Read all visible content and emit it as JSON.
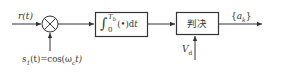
{
  "diagram": {
    "type": "block-diagram",
    "title": "",
    "input": {
      "label_main": "r",
      "label_arg": "(t)"
    },
    "multiplier": {
      "symbol": "⊗"
    },
    "carrier": {
      "label_s": "s",
      "label_sub": "1",
      "label_rest": "(t)=cos(ω",
      "label_csub": "c",
      "label_end": "t)"
    },
    "integrator": {
      "int_symbol": "∫",
      "upper_limit": "T",
      "upper_sub": "b",
      "lower_limit": "0",
      "body": "(•)d",
      "var": "t"
    },
    "decision": {
      "label": "判决"
    },
    "threshold": {
      "label_main": "V",
      "label_sub": "d"
    },
    "output": {
      "open": "{",
      "label_main": "a",
      "label_sub": "k",
      "close": "}"
    },
    "colors": {
      "line": "#333333",
      "background": "#ffffff"
    }
  }
}
